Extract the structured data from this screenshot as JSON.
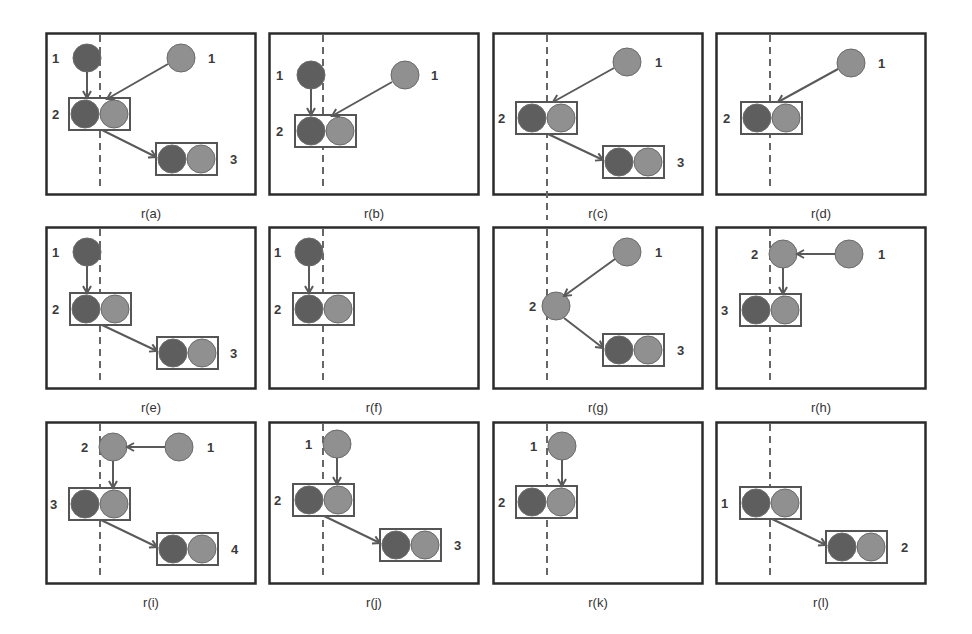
{
  "figure": {
    "colors": {
      "border": "#2b2b2b",
      "dark_node": "#5e5e5e",
      "light_node": "#909090",
      "node_stroke": "#6a6a6a",
      "box": "#555555",
      "arrow": "#5a5a5a",
      "dashed_line": "#666666"
    },
    "dashed_line_x": 55,
    "panels": [
      {
        "id": "a",
        "caption": "r(a)",
        "x": 45,
        "y": 32,
        "nodes": [
          {
            "type": "single",
            "shade": "dark",
            "x": 42,
            "y": 26,
            "label": "1",
            "label_x": 7,
            "label_y": 31
          },
          {
            "type": "single",
            "shade": "light",
            "x": 136,
            "y": 26,
            "label": "1",
            "label_x": 163,
            "label_y": 31
          },
          {
            "type": "pair",
            "x": 24,
            "y": 66,
            "label": "2",
            "label_x": 7,
            "label_y": 87
          },
          {
            "type": "pair",
            "x": 111,
            "y": 111,
            "label": "3",
            "label_x": 185,
            "label_y": 132
          }
        ],
        "arrows": [
          {
            "x1": 42,
            "y1": 40,
            "x2": 42,
            "y2": 66
          },
          {
            "x1": 123,
            "y1": 32,
            "x2": 62,
            "y2": 67
          },
          {
            "x1": 57,
            "y1": 98,
            "x2": 111,
            "y2": 125
          }
        ]
      },
      {
        "id": "b",
        "caption": "r(b)",
        "x": 268,
        "y": 32,
        "nodes": [
          {
            "type": "single",
            "shade": "dark",
            "x": 43,
            "y": 43,
            "label": "1",
            "label_x": 8,
            "label_y": 48
          },
          {
            "type": "single",
            "shade": "light",
            "x": 137,
            "y": 43,
            "label": "1",
            "label_x": 163,
            "label_y": 48
          },
          {
            "type": "pair",
            "x": 27,
            "y": 83,
            "label": "2",
            "label_x": 8,
            "label_y": 104
          }
        ],
        "arrows": [
          {
            "x1": 43,
            "y1": 57,
            "x2": 43,
            "y2": 83
          },
          {
            "x1": 124,
            "y1": 50,
            "x2": 64,
            "y2": 84
          }
        ]
      },
      {
        "id": "c",
        "caption": "r(c)",
        "x": 492,
        "y": 32,
        "nodes": [
          {
            "type": "single",
            "shade": "light",
            "x": 135,
            "y": 30,
            "label": "1",
            "label_x": 163,
            "label_y": 35
          },
          {
            "type": "pair",
            "x": 24,
            "y": 70,
            "label": "2",
            "label_x": 6,
            "label_y": 91
          },
          {
            "type": "pair",
            "x": 111,
            "y": 114,
            "label": "3",
            "label_x": 185,
            "label_y": 135
          }
        ],
        "arrows": [
          {
            "x1": 122,
            "y1": 36,
            "x2": 61,
            "y2": 70
          },
          {
            "x1": 56,
            "y1": 102,
            "x2": 111,
            "y2": 128
          }
        ],
        "dashed_extends": true
      },
      {
        "id": "d",
        "caption": "r(d)",
        "x": 715,
        "y": 32,
        "nodes": [
          {
            "type": "single",
            "shade": "light",
            "x": 136,
            "y": 31,
            "label": "1",
            "label_x": 163,
            "label_y": 36
          },
          {
            "type": "pair",
            "x": 26,
            "y": 70,
            "label": "2",
            "label_x": 8,
            "label_y": 91
          }
        ],
        "arrows": [
          {
            "x1": 123,
            "y1": 37,
            "x2": 63,
            "y2": 70
          }
        ]
      },
      {
        "id": "e",
        "caption": "r(e)",
        "x": 45,
        "y": 226,
        "nodes": [
          {
            "type": "single",
            "shade": "dark",
            "x": 42,
            "y": 26,
            "label": "1",
            "label_x": 7,
            "label_y": 31
          },
          {
            "type": "pair",
            "x": 25,
            "y": 67,
            "label": "2",
            "label_x": 7,
            "label_y": 88
          },
          {
            "type": "pair",
            "x": 112,
            "y": 111,
            "label": "3",
            "label_x": 185,
            "label_y": 132
          }
        ],
        "arrows": [
          {
            "x1": 42,
            "y1": 40,
            "x2": 42,
            "y2": 67
          },
          {
            "x1": 57,
            "y1": 99,
            "x2": 112,
            "y2": 125
          }
        ]
      },
      {
        "id": "f",
        "caption": "r(f)",
        "x": 268,
        "y": 226,
        "nodes": [
          {
            "type": "single",
            "shade": "dark",
            "x": 41,
            "y": 26,
            "label": "1",
            "label_x": 6,
            "label_y": 31
          },
          {
            "type": "pair",
            "x": 25,
            "y": 67,
            "label": "2",
            "label_x": 6,
            "label_y": 88
          }
        ],
        "arrows": [
          {
            "x1": 41,
            "y1": 40,
            "x2": 41,
            "y2": 67
          }
        ]
      },
      {
        "id": "g",
        "caption": "r(g)",
        "x": 492,
        "y": 226,
        "nodes": [
          {
            "type": "single",
            "shade": "light",
            "x": 135,
            "y": 26,
            "label": "1",
            "label_x": 163,
            "label_y": 31
          },
          {
            "type": "single",
            "shade": "light",
            "x": 64,
            "y": 80,
            "label": "2",
            "label_x": 37,
            "label_y": 85
          },
          {
            "type": "pair",
            "x": 111,
            "y": 108,
            "label": "3",
            "label_x": 185,
            "label_y": 129
          }
        ],
        "arrows": [
          {
            "x1": 123,
            "y1": 33,
            "x2": 72,
            "y2": 70
          },
          {
            "x1": 72,
            "y1": 92,
            "x2": 111,
            "y2": 122
          }
        ]
      },
      {
        "id": "h",
        "caption": "r(h)",
        "x": 715,
        "y": 226,
        "nodes": [
          {
            "type": "single",
            "shade": "light",
            "x": 68,
            "y": 28,
            "label": "2",
            "label_x": 36,
            "label_y": 33
          },
          {
            "type": "single",
            "shade": "light",
            "x": 134,
            "y": 28,
            "label": "1",
            "label_x": 163,
            "label_y": 33
          },
          {
            "type": "pair",
            "x": 25,
            "y": 68,
            "label": "3",
            "label_x": 6,
            "label_y": 89
          }
        ],
        "arrows": [
          {
            "x1": 120,
            "y1": 28,
            "x2": 82,
            "y2": 28
          },
          {
            "x1": 68,
            "y1": 42,
            "x2": 68,
            "y2": 68
          }
        ]
      },
      {
        "id": "i",
        "caption": "r(i)",
        "x": 45,
        "y": 421,
        "nodes": [
          {
            "type": "single",
            "shade": "light",
            "x": 68,
            "y": 26,
            "label": "2",
            "label_x": 36,
            "label_y": 31
          },
          {
            "type": "single",
            "shade": "light",
            "x": 134,
            "y": 26,
            "label": "1",
            "label_x": 162,
            "label_y": 31
          },
          {
            "type": "pair",
            "x": 24,
            "y": 67,
            "label": "3",
            "label_x": 5,
            "label_y": 88
          },
          {
            "type": "pair",
            "x": 112,
            "y": 112,
            "label": "4",
            "label_x": 186,
            "label_y": 133
          }
        ],
        "arrows": [
          {
            "x1": 120,
            "y1": 26,
            "x2": 82,
            "y2": 26
          },
          {
            "x1": 68,
            "y1": 40,
            "x2": 68,
            "y2": 67
          },
          {
            "x1": 56,
            "y1": 99,
            "x2": 112,
            "y2": 126
          }
        ]
      },
      {
        "id": "j",
        "caption": "r(j)",
        "x": 268,
        "y": 421,
        "nodes": [
          {
            "type": "single",
            "shade": "light",
            "x": 69,
            "y": 23,
            "label": "1",
            "label_x": 37,
            "label_y": 28
          },
          {
            "type": "pair",
            "x": 25,
            "y": 63,
            "label": "2",
            "label_x": 6,
            "label_y": 84
          },
          {
            "type": "pair",
            "x": 112,
            "y": 108,
            "label": "3",
            "label_x": 186,
            "label_y": 129
          }
        ],
        "arrows": [
          {
            "x1": 69,
            "y1": 37,
            "x2": 69,
            "y2": 63
          },
          {
            "x1": 56,
            "y1": 95,
            "x2": 112,
            "y2": 122
          }
        ]
      },
      {
        "id": "k",
        "caption": "r(k)",
        "x": 492,
        "y": 421,
        "nodes": [
          {
            "type": "single",
            "shade": "light",
            "x": 70,
            "y": 25,
            "label": "1",
            "label_x": 38,
            "label_y": 30
          },
          {
            "type": "pair",
            "x": 24,
            "y": 65,
            "label": "2",
            "label_x": 6,
            "label_y": 86
          }
        ],
        "arrows": [
          {
            "x1": 70,
            "y1": 39,
            "x2": 70,
            "y2": 65
          }
        ]
      },
      {
        "id": "l",
        "caption": "r(l)",
        "x": 715,
        "y": 421,
        "nodes": [
          {
            "type": "pair",
            "x": 25,
            "y": 66,
            "label": "1",
            "label_x": 6,
            "label_y": 87
          },
          {
            "type": "pair",
            "x": 111,
            "y": 110,
            "label": "2",
            "label_x": 186,
            "label_y": 131
          }
        ],
        "arrows": [
          {
            "x1": 57,
            "y1": 98,
            "x2": 111,
            "y2": 124
          }
        ]
      }
    ]
  }
}
